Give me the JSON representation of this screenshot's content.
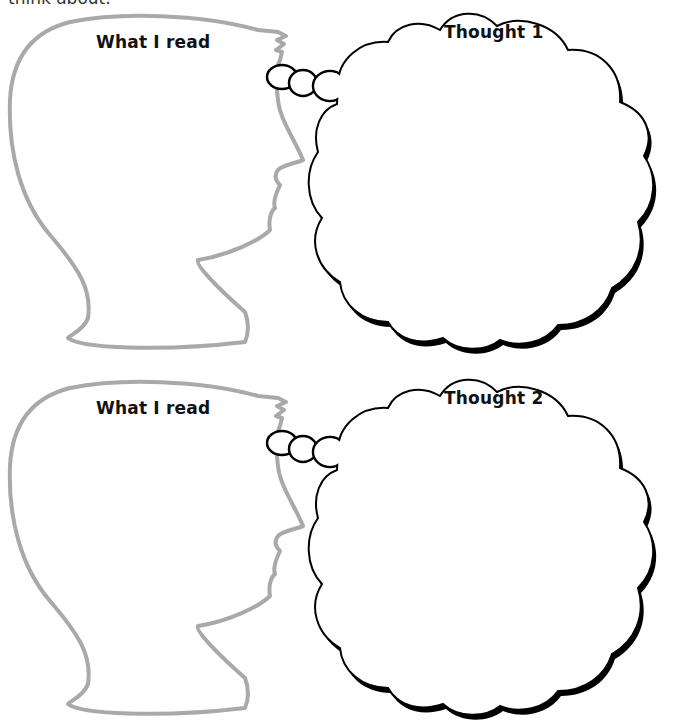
{
  "intro_text": "think about.",
  "panels": [
    {
      "reader_label": "What I read",
      "thought_label": "Thought 1"
    },
    {
      "reader_label": "What I read",
      "thought_label": "Thought 2"
    }
  ],
  "colors": {
    "head_outline": "#a9a9a9",
    "cloud_outline": "#000000",
    "background": "#ffffff"
  }
}
